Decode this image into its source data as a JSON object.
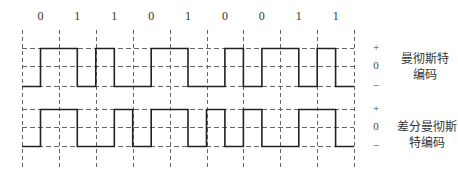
{
  "bits": [
    "0",
    "1",
    "1",
    "0",
    "1",
    "0",
    "0",
    "1",
    "1"
  ],
  "grid": {
    "x_start": 22,
    "bit_width": 36.9,
    "color": "#555555"
  },
  "waveforms": [
    {
      "name": "manchester",
      "title_line1": "曼彻斯特",
      "title_line2": "编码",
      "level_plus": "+",
      "level_zero": "0",
      "level_minus": "−",
      "y_high": 48,
      "y_mid": 66,
      "y_low": 86,
      "half_bit_levels": [
        0,
        1,
        1,
        0,
        1,
        0,
        0,
        1,
        1,
        0,
        0,
        1,
        0,
        1,
        1,
        0,
        1,
        0
      ]
    },
    {
      "name": "differential-manchester",
      "title_line1": "差分曼彻斯",
      "title_line2": "特编码",
      "level_plus": "+",
      "level_zero": "0",
      "level_minus": "−",
      "y_high": 109,
      "y_mid": 127,
      "y_low": 146,
      "half_bit_levels": [
        0,
        1,
        1,
        0,
        0,
        1,
        0,
        1,
        1,
        0,
        1,
        0,
        1,
        0,
        0,
        1,
        1,
        0
      ]
    }
  ],
  "colors": {
    "signal": "#222222",
    "dashed": "#666666",
    "text": "#333333"
  }
}
